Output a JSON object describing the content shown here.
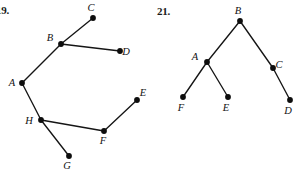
{
  "page": {
    "width": 303,
    "height": 175,
    "background": "#ffffff",
    "ink_color": "#111111"
  },
  "problems": [
    {
      "id": "problem-19",
      "number_label": "19.",
      "number_pos": {
        "x": -4,
        "y": 4
      },
      "type": "tree-graph",
      "vertices": [
        {
          "name": "A",
          "x": 22,
          "y": 83,
          "label": "A",
          "label_dx": -10,
          "label_dy": 3
        },
        {
          "name": "B",
          "x": 61,
          "y": 44,
          "label": "B",
          "label_dx": -11,
          "label_dy": -3
        },
        {
          "name": "C",
          "x": 93,
          "y": 18,
          "label": "C",
          "label_dx": -2,
          "label_dy": -7
        },
        {
          "name": "D",
          "x": 120,
          "y": 51,
          "label": "D",
          "label_dx": 6,
          "label_dy": 4
        },
        {
          "name": "E",
          "x": 137,
          "y": 100,
          "label": "E",
          "label_dx": 6,
          "label_dy": -4
        },
        {
          "name": "F",
          "x": 104,
          "y": 131,
          "label": "F",
          "label_dx": -1,
          "label_dy": 13
        },
        {
          "name": "G",
          "x": 69,
          "y": 156,
          "label": "G",
          "label_dx": -2,
          "label_dy": 13
        },
        {
          "name": "H",
          "x": 41,
          "y": 120,
          "label": "H",
          "label_dx": -12,
          "label_dy": 4
        }
      ],
      "edges": [
        {
          "from": "A",
          "to": "B"
        },
        {
          "from": "B",
          "to": "C"
        },
        {
          "from": "B",
          "to": "D"
        },
        {
          "from": "A",
          "to": "H"
        },
        {
          "from": "H",
          "to": "F"
        },
        {
          "from": "H",
          "to": "G"
        },
        {
          "from": "F",
          "to": "E"
        }
      ]
    },
    {
      "id": "problem-21",
      "number_label": "21.",
      "number_pos": {
        "x": 157,
        "y": 5
      },
      "type": "tree-graph",
      "vertices": [
        {
          "name": "B",
          "x": 240,
          "y": 21,
          "label": "B",
          "label_dx": -2,
          "label_dy": -7
        },
        {
          "name": "A",
          "x": 207,
          "y": 62,
          "label": "A",
          "label_dx": -12,
          "label_dy": -2
        },
        {
          "name": "C",
          "x": 273,
          "y": 68,
          "label": "C",
          "label_dx": 6,
          "label_dy": 0
        },
        {
          "name": "F",
          "x": 183,
          "y": 97,
          "label": "F",
          "label_dx": -2,
          "label_dy": 14
        },
        {
          "name": "E",
          "x": 228,
          "y": 97,
          "label": "E",
          "label_dx": -2,
          "label_dy": 14
        },
        {
          "name": "D",
          "x": 290,
          "y": 100,
          "label": "D",
          "label_dx": -2,
          "label_dy": 14
        }
      ],
      "edges": [
        {
          "from": "B",
          "to": "A"
        },
        {
          "from": "B",
          "to": "C"
        },
        {
          "from": "A",
          "to": "F"
        },
        {
          "from": "A",
          "to": "E"
        },
        {
          "from": "C",
          "to": "D"
        }
      ]
    }
  ],
  "style": {
    "vertex_radius": 2.9,
    "edge_width": 1.35,
    "vertex_fill": "#0d0d0d",
    "edge_stroke": "#151515"
  }
}
